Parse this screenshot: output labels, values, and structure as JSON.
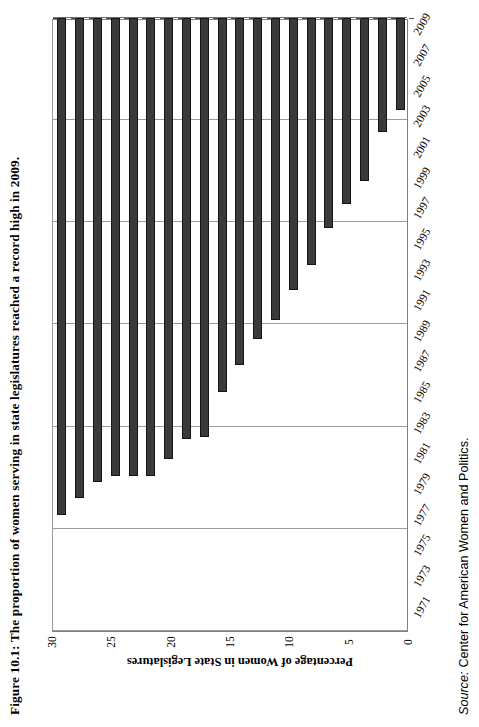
{
  "figure": {
    "caption": "Figure 10.1: The proportion of women serving in state legislatures reached a record high in 2009.",
    "source_label": "Source:",
    "source_text": "Center for American Women and Politics."
  },
  "chart_data": {
    "type": "bar",
    "orientation": "horizontal",
    "title": "Figure 10.1: The proportion of women serving in state legislatures reached a record high in 2009.",
    "xlabel": "",
    "ylabel": "Percentage of Women in State Legislatures",
    "ylim": [
      0,
      30
    ],
    "grid": true,
    "legend": "none",
    "tick_labels": [
      "0",
      "5",
      "10",
      "15",
      "20",
      "25",
      "30"
    ],
    "ticks": [
      0,
      5,
      10,
      15,
      20,
      25,
      30
    ],
    "categories": [
      "1971",
      "1973",
      "1975",
      "1977",
      "1979",
      "1981",
      "1983",
      "1985",
      "1987",
      "1989",
      "1991",
      "1993",
      "1995",
      "1997",
      "1999",
      "2001",
      "2003",
      "2005",
      "2007",
      "2009"
    ],
    "values": [
      4.5,
      5.6,
      8.0,
      9.1,
      10.3,
      12.1,
      13.3,
      14.8,
      15.7,
      17.0,
      18.3,
      20.5,
      20.6,
      21.6,
      22.4,
      22.4,
      22.4,
      22.7,
      23.5,
      24.3
    ],
    "bar_color": "#3a3a3a",
    "grid_color": "#9b9b9b",
    "frame_color": "#808080"
  }
}
